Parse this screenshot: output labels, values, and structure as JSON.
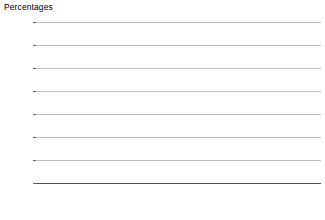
{
  "chart_data": {
    "type": "bar",
    "title": "Percentages",
    "xlabel": "",
    "ylabel": "",
    "ylim": [
      0,
      35
    ],
    "ytick_step": 5,
    "ytick_labels": [
      "0",
      "5",
      "10",
      "15",
      "20",
      "25",
      "30",
      "35"
    ],
    "grid": true,
    "legend_position": "top-left",
    "panels": [
      {
        "name": "Males",
        "categories": [
          "60–64",
          "70–74",
          "80 and over"
        ],
        "series": [
          {
            "name": "Bank or cashpoint",
            "values": [
              4.3,
              4.3,
              23.0
            ]
          },
          {
            "name": "Local shops",
            "values": [
              3.7,
              3.1,
              17.2
            ]
          },
          {
            "name": "Post office",
            "values": [
              2.2,
              2.4,
              14.5
            ]
          },
          {
            "name": "Shopping centre",
            "values": [
              5.0,
              4.6,
              22.0
            ]
          }
        ]
      },
      {
        "name": "Females",
        "categories": [
          "60–64",
          "70–74",
          "80 and over"
        ],
        "series": [
          {
            "name": "Bank or cashpoint",
            "values": [
              4.0,
              9.5,
              28.6
            ]
          },
          {
            "name": "Local shops",
            "values": [
              3.0,
              7.5,
              24.0
            ]
          },
          {
            "name": "Post office",
            "values": [
              3.0,
              5.6,
              22.0
            ]
          },
          {
            "name": "Shopping centre",
            "values": [
              5.0,
              11.0,
              30.0
            ]
          }
        ]
      }
    ],
    "series_colors": [
      "#2b2b2b",
      "#737373",
      "#c4c4c4",
      "#efefef"
    ]
  },
  "legend": {
    "items": [
      {
        "label": "Bank or cashpoint",
        "color": "#2b2b2b"
      },
      {
        "label": "Local shops",
        "color": "#737373"
      },
      {
        "label": "Post office",
        "color": "#c4c4c4"
      },
      {
        "label": "Shopping centre",
        "color": "#efefef"
      }
    ]
  }
}
